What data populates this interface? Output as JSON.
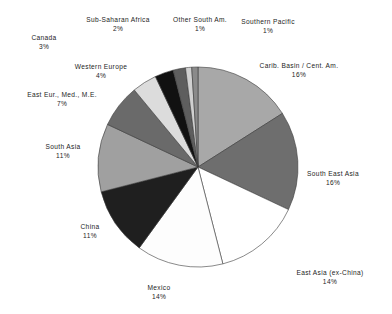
{
  "chart_data": {
    "type": "pie",
    "title": "",
    "subtitle": "",
    "xlabel": "",
    "ylabel": "",
    "legend_position": "none",
    "grid": false,
    "value_unit": "%",
    "start_angle_deg": 0,
    "direction": "clockwise",
    "total": 100,
    "categories": [
      "Carib. Basin / Cent. Am.",
      "South East Asia",
      "East Asia (ex-China)",
      "Mexico",
      "China",
      "South Asia",
      "East Eur., Med., M.E.",
      "Western Europe",
      "Canada",
      "Sub-Saharan Africa",
      "Other South Am.",
      "Southern Pacific"
    ],
    "values": [
      16,
      16,
      14,
      14,
      11,
      11,
      7,
      4,
      3,
      2,
      1,
      1
    ],
    "slice_colors": [
      "#a8a8a8",
      "#6e6e6e",
      "#ffffff",
      "#fdfdfd",
      "#1f1f1f",
      "#a0a0a0",
      "#6a6a6a",
      "#dcdcdc",
      "#111111",
      "#5e5e5e",
      "#d0d0d0",
      "#8a8a8a"
    ],
    "slices": [
      {
        "name": "Carib. Basin / Cent. Am.",
        "value": 16,
        "label": "Carib. Basin / Cent. Am.",
        "percent_label": "16%",
        "color": "#a8a8a8",
        "label_x": 299,
        "label_y": 61,
        "anchor": "middle"
      },
      {
        "name": "South East Asia",
        "value": 16,
        "label": "South East Asia",
        "percent_label": "16%",
        "color": "#6e6e6e",
        "label_x": 333,
        "label_y": 169,
        "anchor": "middle"
      },
      {
        "name": "East Asia (ex-China)",
        "value": 14,
        "label": "East Asia (ex-China)",
        "percent_label": "14%",
        "color": "#ffffff",
        "label_x": 330,
        "label_y": 268,
        "anchor": "middle"
      },
      {
        "name": "Mexico",
        "value": 14,
        "label": "Mexico",
        "percent_label": "14%",
        "color": "#fdfdfd",
        "label_x": 159,
        "label_y": 283,
        "anchor": "middle"
      },
      {
        "name": "China",
        "value": 11,
        "label": "China",
        "percent_label": "11%",
        "color": "#1f1f1f",
        "label_x": 90,
        "label_y": 222,
        "anchor": "middle"
      },
      {
        "name": "South Asia",
        "value": 11,
        "label": "South Asia",
        "percent_label": "11%",
        "color": "#a0a0a0",
        "label_x": 63,
        "label_y": 142,
        "anchor": "middle"
      },
      {
        "name": "East Eur., Med., M.E.",
        "value": 7,
        "label": "East Eur., Med., M.E.",
        "percent_label": "7%",
        "color": "#6a6a6a",
        "label_x": 62,
        "label_y": 90,
        "anchor": "middle"
      },
      {
        "name": "Western Europe",
        "value": 4,
        "label": "Western Europe",
        "percent_label": "4%",
        "color": "#dcdcdc",
        "label_x": 101,
        "label_y": 62,
        "anchor": "middle"
      },
      {
        "name": "Canada",
        "value": 3,
        "label": "Canada",
        "percent_label": "3%",
        "color": "#111111",
        "label_x": 44,
        "label_y": 33,
        "anchor": "middle"
      },
      {
        "name": "Sub-Saharan Africa",
        "value": 2,
        "label": "Sub-Saharan Africa",
        "percent_label": "2%",
        "color": "#5e5e5e",
        "label_x": 118,
        "label_y": 15,
        "anchor": "middle"
      },
      {
        "name": "Other South Am.",
        "value": 1,
        "label": "Other South Am.",
        "percent_label": "1%",
        "color": "#d0d0d0",
        "label_x": 200,
        "label_y": 15,
        "anchor": "middle"
      },
      {
        "name": "Southern Pacific",
        "value": 1,
        "label": "Southern Pacific",
        "percent_label": "1%",
        "color": "#8a8a8a",
        "label_x": 268,
        "label_y": 17,
        "anchor": "middle"
      }
    ],
    "geometry": {
      "center_x": 198,
      "center_y": 167,
      "radius": 100,
      "stroke": "#3a3a3a",
      "stroke_width": 0.6
    },
    "background_color": "#ffffff"
  }
}
